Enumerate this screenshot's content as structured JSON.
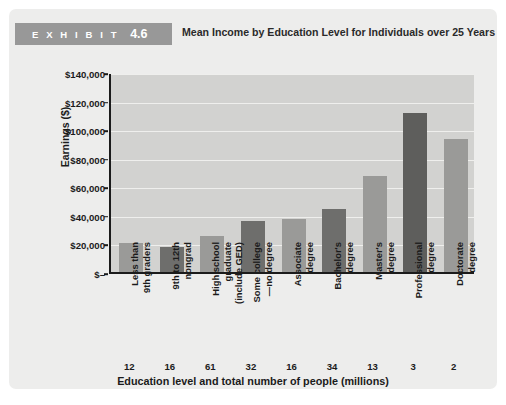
{
  "exhibit": {
    "badge_word": "E X H I B I T",
    "badge_number": "4.6",
    "title": "Mean Income by Education Level for Individuals over 25 Years",
    "badge_color": "#989898"
  },
  "chart_data": {
    "type": "bar",
    "title": "Mean Income by Education Level for Individuals over 25 Years",
    "xlabel": "Education level and total number of people (millions)",
    "ylabel": "Earnings ($)",
    "ylim": [
      0,
      140000
    ],
    "grid": true,
    "legend": "none",
    "categories": [
      "Less than\n9th graders",
      "9th to 12th\nnongrad",
      "High school\ngraduate\n(include GED)",
      "Some college\n—no degree",
      "Associate\ndegree",
      "Bachelor's\ndegree",
      "Master's\ndegree",
      "Professional\ndegree",
      "Doctorate\ndegree"
    ],
    "values": [
      20000,
      17500,
      25000,
      35500,
      37000,
      44000,
      67000,
      111000,
      93000
    ],
    "counts_millions": [
      12,
      16,
      61,
      32,
      16,
      34,
      13,
      3,
      2
    ],
    "bar_colors": [
      "#9a9a98",
      "#6e6e6c",
      "#9a9a98",
      "#6e6e6c",
      "#9a9a98",
      "#6e6e6c",
      "#9a9a98",
      "#5e5e5c",
      "#9a9a98"
    ],
    "ytick_labels": [
      "$140,000",
      "$120,000",
      "$100,000",
      "$80,000",
      "$60,000",
      "$40,000",
      "$20,000",
      "$–"
    ],
    "ytick_values": [
      140000,
      120000,
      100000,
      80000,
      60000,
      40000,
      20000,
      0
    ],
    "plot_background": "#d2d2d0",
    "gridline_color": "#efefed",
    "axis_color": "#1b1b1b"
  }
}
